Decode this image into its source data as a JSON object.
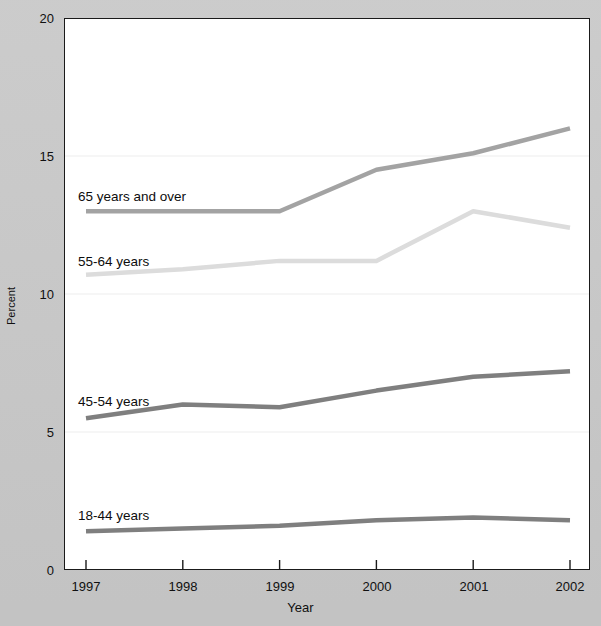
{
  "chart_data": {
    "type": "line",
    "title": "",
    "xlabel": "Year",
    "ylabel": "Percent",
    "categories": [
      "1997",
      "1998",
      "1999",
      "2000",
      "2001",
      "2002"
    ],
    "x": [
      1997,
      1998,
      1999,
      2000,
      2001,
      2002
    ],
    "xlim": [
      1997,
      2002
    ],
    "ylim": [
      0,
      20
    ],
    "yticks": [
      0,
      5,
      10,
      15,
      20
    ],
    "ytick_labels": [
      "0",
      "5",
      "10",
      "15",
      "20"
    ],
    "xticks": [
      1997,
      1998,
      1999,
      2000,
      2001,
      2002
    ],
    "xtick_labels": [
      "1997",
      "1998",
      "1999",
      "2000",
      "2001",
      "2002"
    ],
    "grid": "horizontal-only",
    "legend": "inline-series-labels",
    "series": [
      {
        "name": "65 years and over",
        "color": "#a3a3a3",
        "values": [
          13.0,
          13.0,
          13.0,
          14.5,
          15.1,
          16.0
        ]
      },
      {
        "name": "55-64 years",
        "color": "#dcdcdc",
        "values": [
          10.7,
          10.9,
          11.2,
          11.2,
          13.0,
          12.4
        ]
      },
      {
        "name": "45-54 years",
        "color": "#7f7f7f",
        "values": [
          5.5,
          6.0,
          5.9,
          6.5,
          7.0,
          7.2
        ]
      },
      {
        "name": "18-44 years",
        "color": "#7f7f7f",
        "values": [
          1.4,
          1.5,
          1.6,
          1.8,
          1.9,
          1.8
        ]
      }
    ],
    "annotations": [
      {
        "text": "65 years and over",
        "x_px": 78,
        "y_px": 196
      },
      {
        "text": "55-64 years",
        "x_px": 78,
        "y_px": 261
      },
      {
        "text": "45-54 years",
        "x_px": 78,
        "y_px": 401
      },
      {
        "text": "18-44 years",
        "x_px": 78,
        "y_px": 515
      }
    ]
  },
  "axes": {
    "y_label": "Percent",
    "x_label": "Year",
    "y_ticks": [
      "20",
      "15",
      "10",
      "5",
      "0"
    ],
    "x_ticks": [
      "1997",
      "1998",
      "1999",
      "2000",
      "2001",
      "2002"
    ]
  },
  "colors": {
    "background": "#c9c9c9",
    "plot_background": "#ffffff",
    "axis": "#1a1a1a",
    "gridline": "#ededed",
    "series_65_plus": "#a3a3a3",
    "series_55_64": "#dcdcdc",
    "series_45_54": "#7f7f7f",
    "series_18_44": "#7f7f7f",
    "text": "#101010"
  }
}
